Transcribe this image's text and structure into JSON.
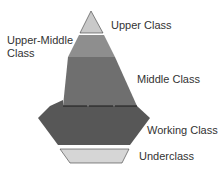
{
  "diagram": {
    "type": "social-class-pyramid",
    "layers": [
      {
        "id": "upper",
        "label": "Upper Class",
        "color": "#c9c9c9"
      },
      {
        "id": "upper-middle",
        "label_lines": [
          "Upper-Middle",
          "Class"
        ],
        "color": "#8e8e8e"
      },
      {
        "id": "middle",
        "label": "Middle Class",
        "color": "#6f6f6f"
      },
      {
        "id": "working",
        "label": "Working Class",
        "color": "#575757"
      },
      {
        "id": "under",
        "label": "Underclass",
        "color": "#d6d6d6"
      }
    ],
    "outline_color": "#3a3a3a",
    "divider_color": "#1a1a1a"
  }
}
